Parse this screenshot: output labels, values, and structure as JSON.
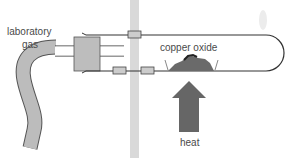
{
  "diagram": {
    "labels": {
      "gas": [
        "laboratory",
        "gas"
      ],
      "sample": "copper oxide",
      "heat": "heat"
    },
    "components": [
      {
        "name": "gas-hose",
        "description": "curved rubber tubing carrying laboratory gas"
      },
      {
        "name": "stopper",
        "description": "rubber bung in tube mouth"
      },
      {
        "name": "inlet-tube",
        "description": "glass delivery tube through stopper"
      },
      {
        "name": "stand-rod",
        "description": "vertical clamp stand rod"
      },
      {
        "name": "clamps",
        "count": 3
      },
      {
        "name": "test-tube",
        "description": "horizontal boiling tube with rounded end"
      },
      {
        "name": "copper-oxide-sample",
        "description": "heap of powder inside tube"
      },
      {
        "name": "heat-arrow",
        "description": "upward arrow indicating heating"
      },
      {
        "name": "gas-flame",
        "description": "small flame at tube end"
      }
    ],
    "colors": {
      "line": "#333333",
      "stopper": "#bdbdbd",
      "hose": "#bcbcbc",
      "rod": "#d9d9d9",
      "clamp": "#cccccc",
      "arrow": "#666666",
      "text": "#4a4a4a"
    }
  }
}
